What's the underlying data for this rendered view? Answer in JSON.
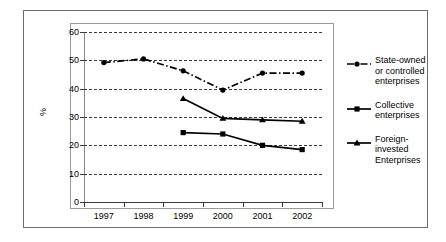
{
  "chart_data": {
    "type": "line",
    "title": "",
    "xlabel": "",
    "ylabel": "%",
    "categories": [
      "1997",
      "1998",
      "1999",
      "2000",
      "2001",
      "2002"
    ],
    "ylim": [
      0,
      60
    ],
    "yticks": [
      0,
      10,
      20,
      30,
      40,
      50,
      60
    ],
    "grid": true,
    "legend_position": "right",
    "series": [
      {
        "name": "State-owned or controlled enterprises",
        "marker": "circle",
        "linestyle": "dash-dot",
        "color": "#000000",
        "values": [
          49.2,
          50.5,
          46.3,
          39.5,
          45.5,
          45.5
        ]
      },
      {
        "name": "Collective enterprises",
        "marker": "square",
        "linestyle": "solid",
        "color": "#000000",
        "values": [
          null,
          null,
          24.5,
          24.0,
          20.0,
          18.5
        ]
      },
      {
        "name": "Foreign-invested Enterprises",
        "marker": "triangle",
        "linestyle": "solid",
        "color": "#000000",
        "values": [
          null,
          null,
          36.5,
          29.5,
          29.0,
          28.5
        ]
      }
    ]
  },
  "legend": {
    "items": [
      {
        "label": "State-owned or controlled enterprises",
        "marker": "circle",
        "linestyle": "dash-dot"
      },
      {
        "label": "Collective enterprises",
        "marker": "square",
        "linestyle": "solid"
      },
      {
        "label": "Foreign-invested Enterprises",
        "marker": "triangle",
        "linestyle": "solid"
      }
    ]
  }
}
